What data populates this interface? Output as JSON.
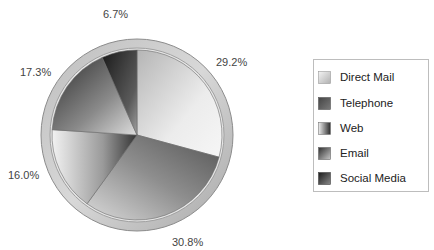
{
  "chart_data": {
    "type": "pie",
    "title": "",
    "categories": [
      "Direct Mail",
      "Telephone",
      "Web",
      "Email",
      "Social Media"
    ],
    "values": [
      29.2,
      30.8,
      16.0,
      17.3,
      6.7
    ],
    "labels": [
      "29.2%",
      "30.8%",
      "16.0%",
      "17.3%",
      "6.7%"
    ],
    "start_angle": "12 o'clock",
    "direction": "clockwise",
    "legend_position": "right",
    "colors": {
      "Direct Mail": [
        "#f4f4f4",
        "#b8b8b8"
      ],
      "Telephone": [
        "#4a4a4a",
        "#9a9a9a"
      ],
      "Web": [
        "#f0f0f0",
        "#3c3c3c"
      ],
      "Email": [
        "#2e2e2e",
        "#c8c8c8"
      ],
      "Social Media": [
        "#1e1e1e",
        "#8a8a8a"
      ]
    }
  },
  "legend": {
    "items": [
      {
        "label": "Direct Mail"
      },
      {
        "label": "Telephone"
      },
      {
        "label": "Web"
      },
      {
        "label": "Email"
      },
      {
        "label": "Social Media"
      }
    ]
  },
  "slice_labels": {
    "direct_mail": "29.2%",
    "telephone": "30.8%",
    "web": "16.0%",
    "email": "17.3%",
    "social_media": "6.7%"
  }
}
